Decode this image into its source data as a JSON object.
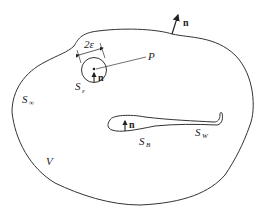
{
  "diagram": {
    "labels": {
      "normal_outer": "n",
      "point": "P",
      "epsilon_dim": "2ε",
      "sphere_S": "S",
      "sphere_sub": "ε",
      "normal_sphere": "n",
      "outer_S": "S",
      "outer_sub": "∞",
      "volume": "V",
      "body_normal": "n",
      "body_S": "S",
      "body_sub": "B",
      "wake_S": "S",
      "wake_sub": "W"
    },
    "colors": {
      "stroke": "#333333",
      "background": "#ffffff"
    }
  }
}
